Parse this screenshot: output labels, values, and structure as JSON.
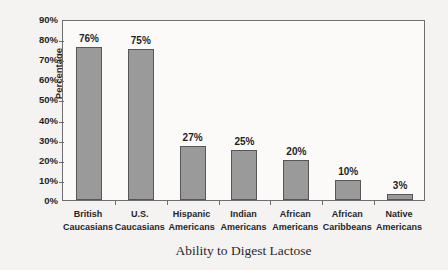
{
  "chart_data": {
    "type": "bar",
    "title": "",
    "xlabel": "Ability to Digest Lactose",
    "ylabel": "Percentage",
    "categories": [
      "British Caucasians",
      "U.S. Caucasians",
      "Hispanic Americans",
      "Indian Americans",
      "African Americans",
      "African Caribbeans",
      "Native Americans"
    ],
    "category_lines": [
      [
        "British",
        "Caucasians"
      ],
      [
        "U.S.",
        "Caucasians"
      ],
      [
        "Hispanic",
        "Americans"
      ],
      [
        "Indian",
        "Americans"
      ],
      [
        "African",
        "Americans"
      ],
      [
        "African",
        "Caribbeans"
      ],
      [
        "Native",
        "Americans"
      ]
    ],
    "values": [
      76,
      75,
      27,
      25,
      20,
      10,
      3
    ],
    "value_labels": [
      "76%",
      "75%",
      "27%",
      "25%",
      "20%",
      "10%",
      "3%"
    ],
    "ylim": [
      0,
      90
    ],
    "ytick_values": [
      0,
      10,
      20,
      30,
      40,
      50,
      60,
      70,
      80,
      90
    ],
    "ytick_labels": [
      "0%",
      "10%",
      "20%",
      "30%",
      "40%",
      "50%",
      "60%",
      "70%",
      "80%",
      "90%"
    ],
    "grid": false,
    "legend": null,
    "bar_color": "#9a9a9a",
    "bar_border_color": "#575757",
    "axis_color": "#6d6d72",
    "text_color": "#1f1f23",
    "background_color": "#f4f3f1",
    "plot_background_color": "#fbfaf9"
  }
}
